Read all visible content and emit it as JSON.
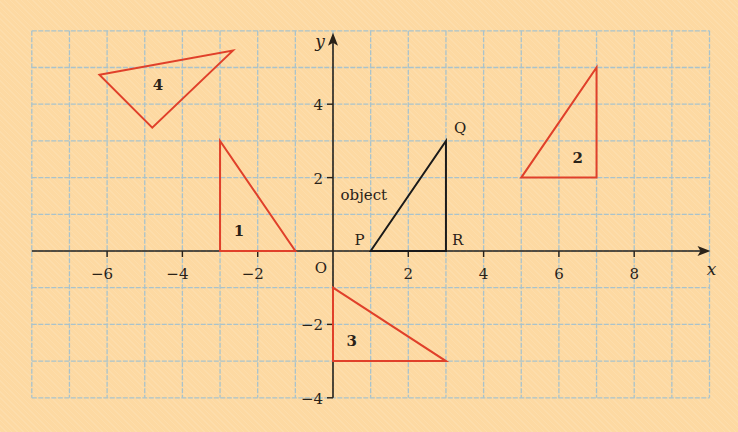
{
  "diagram": {
    "type": "coordinate-grid-transformations",
    "axes": {
      "x_label": "x",
      "y_label": "y",
      "origin_label": "O",
      "x_range": [
        -8,
        10
      ],
      "y_range": [
        -4,
        6
      ],
      "x_ticks": [
        -6,
        -4,
        -2,
        2,
        4,
        6,
        8
      ],
      "y_ticks": [
        -4,
        -2,
        2,
        4
      ],
      "x_tick_labels": [
        "−6",
        "−4",
        "−2",
        "2",
        "4",
        "6",
        "8"
      ],
      "y_tick_labels": [
        "−4",
        "−2",
        "2",
        "4"
      ]
    },
    "object": {
      "label": "object",
      "color": "#1a1a1a",
      "vertices": [
        {
          "name": "P",
          "x": 1,
          "y": 0
        },
        {
          "name": "Q",
          "x": 3,
          "y": 3
        },
        {
          "name": "R",
          "x": 3,
          "y": 0
        }
      ]
    },
    "images": [
      {
        "label": "1",
        "color": "#E0402A",
        "vertices": [
          [
            -3,
            3
          ],
          [
            -3,
            0
          ],
          [
            -1,
            0
          ]
        ],
        "label_pos": [
          -2.5,
          0.4
        ]
      },
      {
        "label": "2",
        "color": "#E0402A",
        "vertices": [
          [
            5,
            2
          ],
          [
            7,
            2
          ],
          [
            7,
            5
          ]
        ],
        "label_pos": [
          6.5,
          2.4
        ]
      },
      {
        "label": "3",
        "color": "#E0402A",
        "vertices": [
          [
            0,
            -1
          ],
          [
            0,
            -3
          ],
          [
            3,
            -3
          ]
        ],
        "label_pos": [
          0.5,
          -2.6
        ]
      },
      {
        "label": "4",
        "color": "#E0402A",
        "vertices": [
          [
            -6.2,
            4.8
          ],
          [
            -2.66,
            5.46
          ],
          [
            -4.8,
            3.36
          ]
        ],
        "label_pos": [
          -4.65,
          4.4
        ]
      }
    ],
    "colors": {
      "background": "#FDD9A2",
      "grid": "#A9C3CC",
      "axis": "#2a2218",
      "image": "#E0402A",
      "object": "#1a1a1a"
    }
  }
}
